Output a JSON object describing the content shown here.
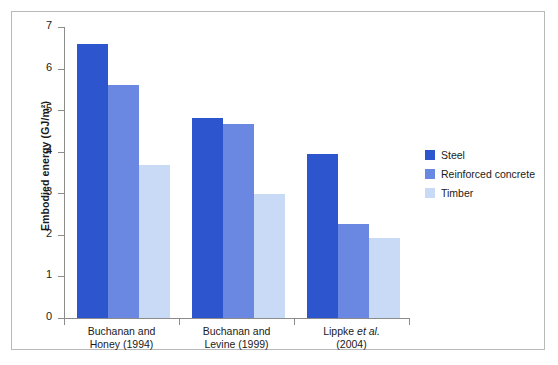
{
  "chart_data": {
    "type": "bar",
    "title": "",
    "xlabel": "",
    "ylabel": "Embodied energy (GJ/m²)",
    "ylim": [
      0,
      7
    ],
    "yticks": [
      0,
      1,
      2,
      3,
      4,
      5,
      6,
      7
    ],
    "ytick_labels": [
      "0",
      "1",
      "2",
      "3",
      "4",
      "5",
      "6",
      "7"
    ],
    "grid": false,
    "legend_position": "right",
    "categories": [
      "Buchanan and Honey (1994)",
      "Buchanan and Levine (1999)",
      "Lippke et al. (2004)"
    ],
    "category_lines": [
      [
        "Buchanan and",
        "Honey (1994)"
      ],
      [
        "Buchanan and",
        "Levine (1999)"
      ],
      [
        "Lippke et al.",
        "(2004)"
      ]
    ],
    "series": [
      {
        "name": "Steel",
        "color": "#2c55ce",
        "values": [
          6.6,
          4.8,
          3.95
        ]
      },
      {
        "name": "Reinforced concrete",
        "color": "#6a87e2",
        "values": [
          5.6,
          4.67,
          2.25
        ]
      },
      {
        "name": "Timber",
        "color": "#c8daf6",
        "values": [
          3.68,
          2.98,
          1.93
        ]
      }
    ]
  },
  "legend": {
    "items": [
      {
        "label": "Steel",
        "color": "#2c55ce"
      },
      {
        "label": "Reinforced concrete",
        "color": "#6a87e2"
      },
      {
        "label": "Timber",
        "color": "#c8daf6"
      }
    ]
  },
  "axes": {
    "y_title": "Embodied energy (GJ/m²)",
    "y_ticks": [
      "7",
      "6",
      "5",
      "4",
      "3",
      "2",
      "1",
      "0"
    ],
    "x_labels": [
      {
        "line1": "Buchanan and",
        "line2": "Honey (1994)",
        "italic": ""
      },
      {
        "line1": "Buchanan and",
        "line2": "Levine (1999)",
        "italic": ""
      },
      {
        "line1_pre": "Lippke ",
        "italic": "et al.",
        "line2": "(2004)"
      }
    ]
  },
  "colors": {
    "steel": "#2c55ce",
    "reinforced_concrete": "#6a87e2",
    "timber": "#c8daf6",
    "axis": "#8c8c8c",
    "frame": "#b9b9b9",
    "text": "#1a1a1a"
  }
}
